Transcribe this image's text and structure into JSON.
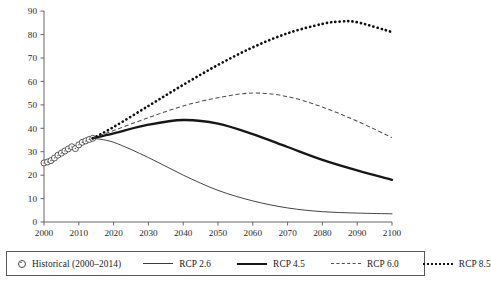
{
  "chart_data": {
    "type": "line",
    "title": "",
    "xlabel": "",
    "ylabel": "",
    "xlim": [
      2000,
      2100
    ],
    "ylim": [
      0,
      90
    ],
    "ytick_step": 10,
    "xtick_step": 10,
    "grid": false,
    "legend_position": "bottom",
    "xticks": [
      "2000",
      "2010",
      "2020",
      "2030",
      "2040",
      "2050",
      "2060",
      "2070",
      "2080",
      "2090",
      "2100"
    ],
    "yticks": [
      "0",
      "10",
      "20",
      "30",
      "40",
      "50",
      "60",
      "70",
      "80",
      "90"
    ],
    "series": [
      {
        "name": "Historical (2000–2014)",
        "style": "markers",
        "marker": "open-circle",
        "color": "#3d3d3d",
        "x": [
          2000,
          2001,
          2002,
          2003,
          2004,
          2005,
          2006,
          2007,
          2008,
          2009,
          2010,
          2011,
          2012,
          2013,
          2014
        ],
        "values": [
          25.2,
          25.6,
          26.2,
          27.3,
          28.5,
          29.4,
          30.3,
          31.2,
          32.1,
          31.3,
          32.9,
          34.0,
          34.6,
          35.2,
          35.7
        ]
      },
      {
        "name": "RCP 2.6",
        "style": "solid-thin",
        "color": "#3a3a3a",
        "x": [
          2014,
          2020,
          2030,
          2040,
          2050,
          2060,
          2070,
          2080,
          2090,
          2100
        ],
        "values": [
          35.7,
          34.0,
          27.5,
          20.0,
          13.5,
          9.0,
          6.0,
          4.4,
          3.8,
          3.5
        ]
      },
      {
        "name": "RCP 4.5",
        "style": "solid-thick",
        "color": "#171717",
        "x": [
          2014,
          2020,
          2030,
          2040,
          2050,
          2060,
          2070,
          2080,
          2090,
          2100
        ],
        "values": [
          35.7,
          37.8,
          41.5,
          43.5,
          42.0,
          37.5,
          32.0,
          26.5,
          22.0,
          18.0
        ]
      },
      {
        "name": "RCP 6.0",
        "style": "dashed",
        "color": "#4f4f4f",
        "x": [
          2014,
          2020,
          2030,
          2040,
          2050,
          2060,
          2070,
          2080,
          2090,
          2100
        ],
        "values": [
          35.7,
          39.0,
          44.5,
          49.5,
          53.0,
          55.0,
          53.5,
          49.0,
          43.0,
          36.0
        ]
      },
      {
        "name": "RCP 8.5",
        "style": "dotted",
        "color": "#101010",
        "x": [
          2014,
          2020,
          2030,
          2040,
          2050,
          2060,
          2070,
          2080,
          2085,
          2090,
          2100
        ],
        "values": [
          35.7,
          40.5,
          49.5,
          58.5,
          67.0,
          74.5,
          80.5,
          84.5,
          85.5,
          85.2,
          81.0
        ]
      }
    ]
  },
  "legend": {
    "items": [
      {
        "label": "Historical (2000–2014)",
        "key": "open-circle-marker"
      },
      {
        "label": "RCP 2.6",
        "key": "thin-solid-line"
      },
      {
        "label": "RCP 4.5",
        "key": "thick-solid-line"
      },
      {
        "label": "RCP 6.0",
        "key": "dashed-line"
      },
      {
        "label": "RCP 8.5",
        "key": "dotted-line"
      }
    ]
  }
}
